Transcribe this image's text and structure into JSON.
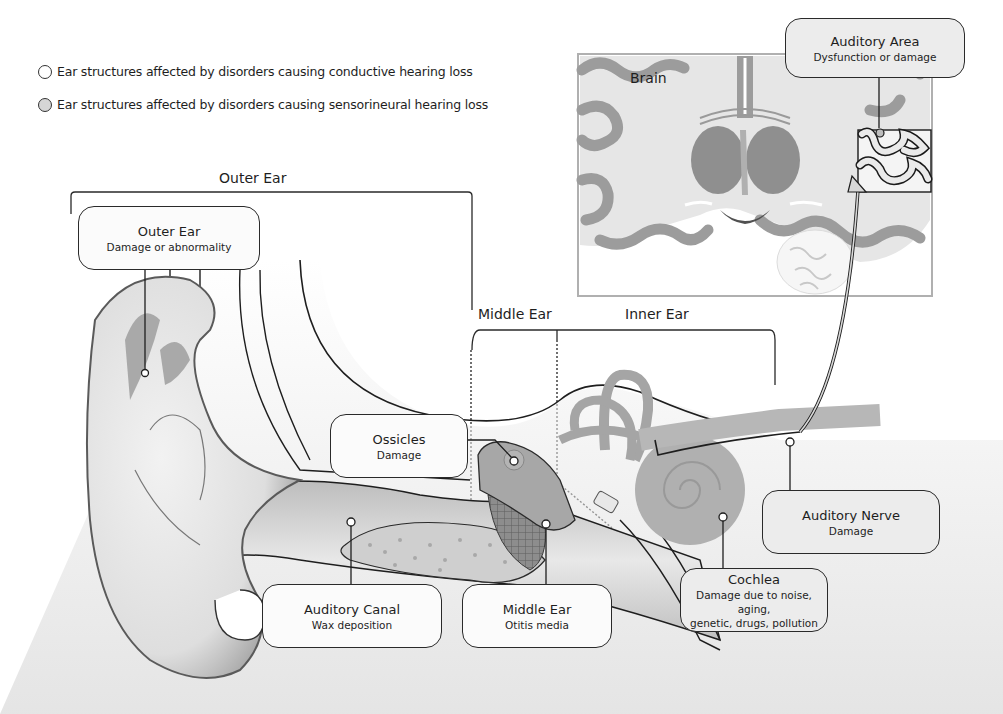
{
  "legend": {
    "items": [
      {
        "label": "Ear structures affected by disorders causing conductive hearing loss",
        "swatch_color": "#ffffff"
      },
      {
        "label": "Ear structures affected by disorders causing sensorineural hearing loss",
        "swatch_color": "#d6d6d6"
      }
    ]
  },
  "sections": {
    "outer_ear": "Outer Ear",
    "middle_ear": "Middle Ear",
    "inner_ear": "Inner Ear",
    "brain": "Brain"
  },
  "callouts": {
    "outer_ear": {
      "title": "Outer Ear",
      "subtitle": "Damage or abnormality",
      "type": "conductive"
    },
    "ossicles": {
      "title": "Ossicles",
      "subtitle": "Damage",
      "type": "conductive"
    },
    "auditory_canal": {
      "title": "Auditory Canal",
      "subtitle": "Wax deposition",
      "type": "conductive"
    },
    "middle_ear": {
      "title": "Middle Ear",
      "subtitle": "Otitis media",
      "type": "conductive"
    },
    "cochlea": {
      "title": "Cochlea",
      "subtitle_line1": "Damage due to noise, aging,",
      "subtitle_line2": "genetic, drugs, pollution",
      "type": "sensorineural"
    },
    "auditory_nerve": {
      "title": "Auditory Nerve",
      "subtitle": "Damage",
      "type": "sensorineural"
    },
    "auditory_area": {
      "title": "Auditory Area",
      "subtitle": "Dysfunction or damage",
      "type": "sensorineural"
    }
  },
  "colors": {
    "conductive_fill": "#fbfbfb",
    "sensorineural_fill": "#ececec",
    "outline": "#2a2a2a",
    "tissue_light": "#e4e4e4",
    "tissue_mid": "#b8b8b8",
    "tissue_dark": "#8a8a8a"
  }
}
